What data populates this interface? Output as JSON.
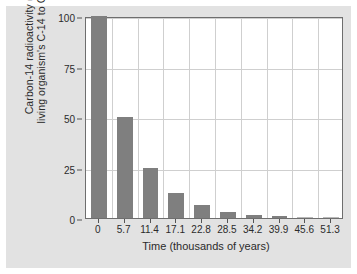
{
  "chart_data": {
    "type": "bar",
    "title": "",
    "xlabel": "Time (thousands of years)",
    "ylabel_lines": [
      "Carbon-14 radioactivity (as % of",
      "living organism's C-14 to C-12 ratio)"
    ],
    "ylabel": "Carbon-14 radioactivity (as % of living organism's C-14 to C-12 ratio)",
    "categories": [
      "0",
      "5.7",
      "11.4",
      "17.1",
      "22.8",
      "28.5",
      "34.2",
      "39.9",
      "45.6",
      "51.3"
    ],
    "values": [
      100,
      50,
      25,
      12.5,
      6.25,
      3.1,
      1.6,
      0.8,
      0.4,
      0.2
    ],
    "ytick_labels": [
      "100",
      "75",
      "50",
      "25",
      "0"
    ],
    "ytick_values": [
      100,
      75,
      50,
      25,
      0
    ],
    "ylim": [
      0,
      100
    ],
    "xlim": [
      0,
      10
    ],
    "grid": "both",
    "legend": "none",
    "bar_color": "#7f7f7f",
    "grid_color": "#cfcfcf",
    "frame_color": "#6e6e6e",
    "plot_background": "#ffffff",
    "figure_background": "#e2e2e2"
  }
}
